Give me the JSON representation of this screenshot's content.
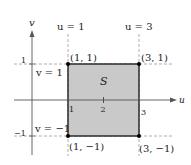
{
  "diagram": {
    "type": "region-in-uv-plane",
    "axes": {
      "horizontal_label": "u",
      "vertical_label": "v",
      "u_ticks": [
        "1",
        "2",
        "3"
      ],
      "v_ticks": [
        "1",
        "−1"
      ]
    },
    "region": {
      "label": "S",
      "fill_color": "#c9c9c9",
      "border_color": "#111111"
    },
    "boundary_lines": {
      "u_left": "u = 1",
      "u_right": "u = 3",
      "v_top": "v = 1",
      "v_bottom": "v = −1"
    },
    "vertices": [
      {
        "label": "(1, 1)"
      },
      {
        "label": "(3, 1)"
      },
      {
        "label": "(1, −1)"
      },
      {
        "label": "(3, −1)"
      }
    ],
    "colors": {
      "axis": "#555555",
      "dashed": "#9a9a9a",
      "vertex": "#000000"
    }
  }
}
